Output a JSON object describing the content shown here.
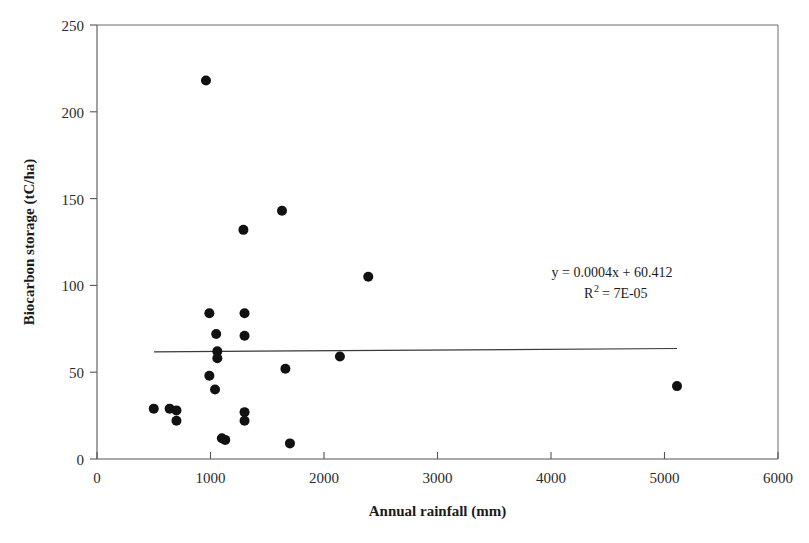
{
  "chart_data": {
    "type": "scatter",
    "title": "",
    "xlabel": "Annual rainfall (mm)",
    "ylabel": "Biocarbon storage (tC/ha)",
    "xlim": [
      0,
      6000
    ],
    "ylim": [
      0,
      250
    ],
    "xticks": [
      0,
      1000,
      2000,
      3000,
      4000,
      5000,
      6000
    ],
    "yticks": [
      0,
      50,
      100,
      150,
      200,
      250
    ],
    "xtick_labels": [
      "0",
      "1000",
      "2000",
      "3000",
      "4000",
      "5000",
      "6000"
    ],
    "ytick_labels": [
      "0",
      "50",
      "100",
      "150",
      "200",
      "250"
    ],
    "grid": false,
    "legend": false,
    "marker": "filled-circle",
    "marker_color": "#111111",
    "points": [
      {
        "x": 500,
        "y": 29
      },
      {
        "x": 640,
        "y": 29
      },
      {
        "x": 700,
        "y": 28
      },
      {
        "x": 700,
        "y": 22
      },
      {
        "x": 960,
        "y": 218
      },
      {
        "x": 990,
        "y": 84
      },
      {
        "x": 990,
        "y": 48
      },
      {
        "x": 1050,
        "y": 72
      },
      {
        "x": 1060,
        "y": 62
      },
      {
        "x": 1060,
        "y": 58
      },
      {
        "x": 1040,
        "y": 40
      },
      {
        "x": 1100,
        "y": 12
      },
      {
        "x": 1130,
        "y": 11
      },
      {
        "x": 1290,
        "y": 132
      },
      {
        "x": 1300,
        "y": 84
      },
      {
        "x": 1300,
        "y": 71
      },
      {
        "x": 1300,
        "y": 27
      },
      {
        "x": 1300,
        "y": 22
      },
      {
        "x": 1630,
        "y": 143
      },
      {
        "x": 1660,
        "y": 52
      },
      {
        "x": 1700,
        "y": 9
      },
      {
        "x": 2140,
        "y": 59
      },
      {
        "x": 2390,
        "y": 105
      },
      {
        "x": 5110,
        "y": 42
      }
    ],
    "trendline": {
      "equation": "y = 0.0004x + 60.412",
      "r_squared_label": "R",
      "r_squared_sup": "2",
      "r_squared_value": "= 7E-05",
      "r_squared_full": "R² = 7E-05",
      "slope": 0.0004,
      "intercept": 60.412,
      "x_start": 500,
      "x_end": 5110,
      "y_start": 60.6,
      "y_end": 62.5
    },
    "annotations": [
      {
        "id": "equation",
        "text": "y = 0.0004x + 60.412"
      },
      {
        "id": "r-squared",
        "text": "R² = 7E-05"
      }
    ]
  }
}
